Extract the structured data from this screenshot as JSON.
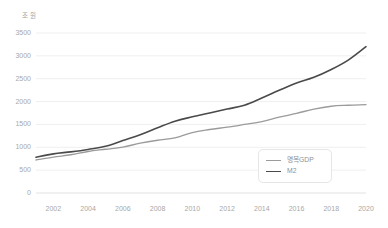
{
  "chart_data": {
    "type": "line",
    "title": "",
    "xlabel": "",
    "ylabel": "조 원",
    "unit_label": "조 원",
    "xlim": [
      2001,
      2020
    ],
    "ylim": [
      0,
      3500
    ],
    "grid": true,
    "legend_position": "bottom-right",
    "yticks": [
      3500,
      3000,
      2500,
      2000,
      1500,
      1000,
      500,
      0
    ],
    "ytick_labels": [
      "3500",
      "3000",
      "2500",
      "2000",
      "1500",
      "1000",
      "500",
      "0"
    ],
    "xticks": [
      2002,
      2004,
      2006,
      2008,
      2010,
      2012,
      2014,
      2016,
      2018,
      2020
    ],
    "xtick_labels": [
      "2002",
      "2004",
      "2006",
      "2008",
      "2010",
      "2012",
      "2014",
      "2016",
      "2018",
      "2020"
    ],
    "x": [
      2001,
      2002,
      2003,
      2004,
      2005,
      2006,
      2007,
      2008,
      2009,
      2010,
      2011,
      2012,
      2013,
      2014,
      2015,
      2016,
      2017,
      2018,
      2019,
      2020
    ],
    "series": [
      {
        "name": "명목GDP",
        "color": "#9b9b9b",
        "width": 1.3,
        "values": [
          722,
          784,
          837,
          908,
          957,
          1005,
          1089,
          1154,
          1205,
          1323,
          1389,
          1440,
          1500,
          1563,
          1658,
          1741,
          1836,
          1898,
          1919,
          1933
        ]
      },
      {
        "name": "M2",
        "color": "#4a4a4a",
        "width": 1.6,
        "values": [
          781,
          856,
          900,
          953,
          1021,
          1147,
          1273,
          1426,
          1570,
          1666,
          1751,
          1836,
          1921,
          2078,
          2247,
          2407,
          2530,
          2701,
          2912,
          3200
        ]
      }
    ]
  },
  "legend": {
    "items": [
      {
        "label": "명목GDP",
        "color": "#9b9b9b"
      },
      {
        "label": "M2",
        "color": "#4a4a4a"
      }
    ]
  }
}
